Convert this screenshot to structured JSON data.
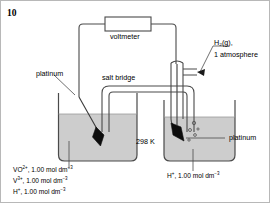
{
  "question": {
    "number": "10"
  },
  "diagram": {
    "meter": {
      "label": "voltmeter"
    },
    "salt_bridge": {
      "label": "salt bridge"
    },
    "temperature": {
      "label": "298 K"
    },
    "gas": {
      "line1": "H₂(g),",
      "line2": "1 atmosphere"
    },
    "electrodes": {
      "left_label": "platinum",
      "right_label": "platinum"
    },
    "left_solution": {
      "line1": {
        "species": "VO",
        "charge": "2+",
        "conc": ", 1.00 mol dm",
        "exp": "−3"
      },
      "line2": {
        "species": "V",
        "charge": "3+",
        "conc": ", 1.00 mol dm",
        "exp": "−3"
      },
      "line3": {
        "species": "H",
        "charge": "+",
        "conc": ", 1.00 mol dm",
        "exp": "−3"
      }
    },
    "right_solution": {
      "line1": {
        "species": "H",
        "charge": "+",
        "conc": ", 1.00 mol dm",
        "exp": "−3"
      }
    },
    "colors": {
      "stroke": "#3a3a3a",
      "solution_fill": "#cdcdcd",
      "electrode_fill": "#0d0d0d",
      "page_bg": "#ffffff",
      "border": "#b8b8b8"
    }
  }
}
